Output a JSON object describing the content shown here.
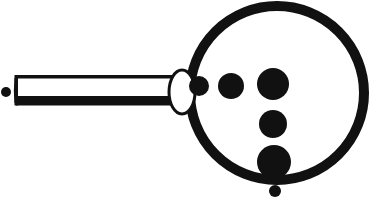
{
  "figure": {
    "title": "Magnifying glass with graduated dot scale",
    "canvas": {
      "width": 386,
      "height": 204
    },
    "background_color": "#ffffff",
    "ink_color": "#111111"
  },
  "chart_data": {
    "type": "scatter",
    "title": "Magnifying glass with graduated dot scale",
    "xlabel": "",
    "ylabel": "",
    "xlim": [
      0,
      386
    ],
    "ylim": [
      0,
      204
    ],
    "grid": false,
    "legend": null,
    "series": [
      {
        "name": "horizontal-dot-row",
        "values": [
          {
            "label": "row-dot-1",
            "x": 199,
            "y": 86,
            "r": 10
          },
          {
            "label": "row-dot-2",
            "x": 231,
            "y": 86,
            "r": 13
          },
          {
            "label": "row-dot-3",
            "x": 273,
            "y": 84,
            "r": 16
          }
        ]
      },
      {
        "name": "vertical-dot-column",
        "values": [
          {
            "label": "col-dot-1",
            "x": 273,
            "y": 124,
            "r": 14
          },
          {
            "label": "col-dot-2",
            "x": 274,
            "y": 162,
            "r": 17
          },
          {
            "label": "col-dot-3",
            "x": 275,
            "y": 191,
            "r": 6
          }
        ]
      },
      {
        "name": "handle-tip-dot",
        "values": [
          {
            "label": "tip-dot",
            "x": 6,
            "y": 92,
            "r": 5
          }
        ]
      }
    ]
  },
  "shapes": {
    "lens_ring": {
      "name": "lens-ring",
      "cx": 277,
      "cy": 93,
      "r": 87,
      "stroke_width": 10,
      "fill": "none",
      "stroke": "#111111"
    },
    "neck_ellipse": {
      "name": "neck-ellipse",
      "cx": 182,
      "cy": 92,
      "rx": 13,
      "ry": 22,
      "stroke_width": 3,
      "fill": "#ffffff",
      "stroke": "#111111"
    },
    "handle": {
      "name": "handle-bar",
      "x": 14,
      "y": 74,
      "width": 168,
      "height": 32,
      "top_border": 3,
      "bottom_border": 9,
      "side_border": 3,
      "fill": "#ffffff",
      "stroke": "#111111"
    },
    "tip_dot": {
      "name": "handle-tip-dot",
      "cx": 6,
      "cy": 92,
      "r": 5,
      "fill": "#111111"
    }
  },
  "labels": {
    "figure_caption": "Magnifying glass with graduated dot scale"
  }
}
